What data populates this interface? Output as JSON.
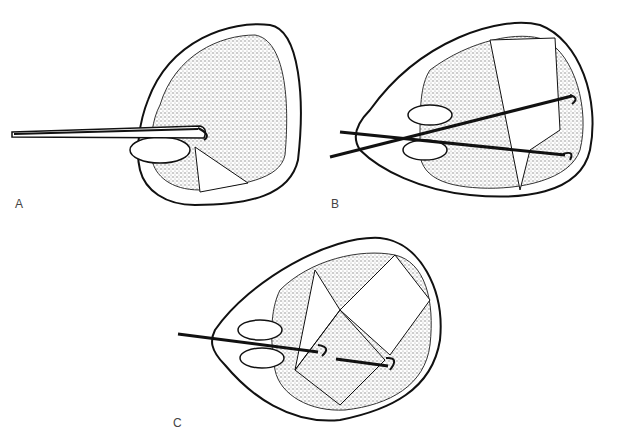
{
  "figure": {
    "panels": [
      {
        "id": "A",
        "label": "A",
        "description": "Single hooked probe inserted through incision; one wedge sector cleared"
      },
      {
        "id": "B",
        "label": "B",
        "description": "Two crossed hooked probes; larger wedge sectors cleared"
      },
      {
        "id": "C",
        "label": "C",
        "description": "Two hooked probes in cross-hatched (diamond grid) pattern"
      }
    ],
    "colors": {
      "ink": "#111111",
      "stipple": "#8a8a8a",
      "background": "#ffffff"
    }
  }
}
